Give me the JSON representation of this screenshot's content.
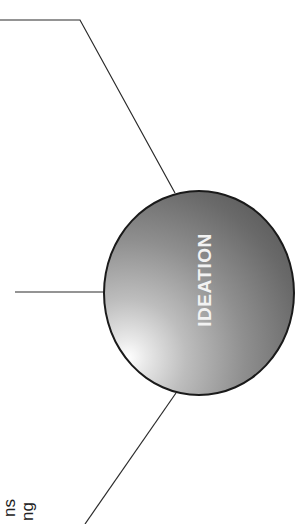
{
  "diagram": {
    "center_node": {
      "label": "IDEATION",
      "fill_highlight": "#ffffff",
      "fill_shadow": "#4e4e4e",
      "border_color": "#1a1a1a"
    },
    "connectors": [
      {
        "name": "top",
        "points": [
          [
            0,
            20
          ],
          [
            80,
            20
          ],
          [
            175,
            193
          ]
        ]
      },
      {
        "name": "middle",
        "points": [
          [
            15,
            292
          ],
          [
            105,
            292
          ]
        ]
      },
      {
        "name": "bottom",
        "points": [
          [
            176,
            393
          ],
          [
            85,
            524
          ]
        ]
      }
    ],
    "side_labels": [
      {
        "text": "ns"
      },
      {
        "text": "ng"
      }
    ]
  }
}
